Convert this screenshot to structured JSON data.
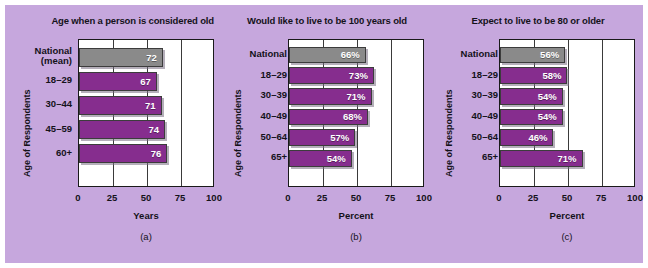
{
  "figure": {
    "background_color": "#c6a7dd",
    "bar_color_purple": "#862d8e",
    "bar_color_gray": "#8a8a8a",
    "plot_background": "#ffffff"
  },
  "chart_data": [
    {
      "type": "bar",
      "orientation": "horizontal",
      "title": "Age when a person is considered old",
      "caption": "(a)",
      "xlabel": "Years",
      "ylabel": "Age of Respondents",
      "xlim": [
        0,
        100
      ],
      "xticks": [
        "0",
        "25",
        "50",
        "75",
        "100"
      ],
      "grid": true,
      "categories": [
        "National\n(mean)",
        "18–29",
        "30–44",
        "45–59",
        "60+"
      ],
      "values": [
        72,
        67,
        71,
        74,
        76
      ],
      "value_labels": [
        "72",
        "67",
        "71",
        "74",
        "76"
      ],
      "highlight_index": 0
    },
    {
      "type": "bar",
      "orientation": "horizontal",
      "title": "Would like to live to be 100 years old",
      "caption": "(b)",
      "xlabel": "Percent",
      "ylabel": "Age of Respondents",
      "xlim": [
        0,
        100
      ],
      "xticks": [
        "0",
        "25",
        "50",
        "75",
        "100"
      ],
      "grid": true,
      "categories": [
        "National",
        "18–29",
        "30–39",
        "40–49",
        "50–64",
        "65+"
      ],
      "values": [
        66,
        73,
        71,
        68,
        57,
        54
      ],
      "value_labels": [
        "66%",
        "73%",
        "71%",
        "68%",
        "57%",
        "54%"
      ],
      "highlight_index": 0
    },
    {
      "type": "bar",
      "orientation": "horizontal",
      "title": "Expect to live to be 80 or older",
      "caption": "(c)",
      "xlabel": "Percent",
      "ylabel": "Age of Respondents",
      "xlim": [
        0,
        100
      ],
      "xticks": [
        "0",
        "25",
        "50",
        "75",
        "100"
      ],
      "grid": true,
      "categories": [
        "National",
        "18–29",
        "30–39",
        "40–49",
        "50–64",
        "65+"
      ],
      "values": [
        56,
        58,
        54,
        54,
        46,
        71
      ],
      "value_labels": [
        "56%",
        "58%",
        "54%",
        "54%",
        "46%",
        "71%"
      ],
      "highlight_index": 0
    }
  ]
}
